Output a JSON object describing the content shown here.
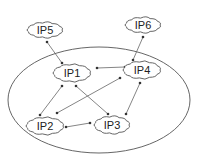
{
  "diagram": {
    "type": "network",
    "boundary": {
      "shape": "ellipse",
      "cx": 99,
      "cy": 100,
      "rx": 91,
      "ry": 53
    },
    "nodes": [
      {
        "id": "IP1",
        "label": "IP1",
        "cx": 72,
        "cy": 73,
        "w": 42,
        "h": 22,
        "inside_boundary": true
      },
      {
        "id": "IP2",
        "label": "IP2",
        "cx": 45,
        "cy": 126,
        "w": 42,
        "h": 22,
        "inside_boundary": true
      },
      {
        "id": "IP3",
        "label": "IP3",
        "cx": 112,
        "cy": 125,
        "w": 40,
        "h": 22,
        "inside_boundary": true
      },
      {
        "id": "IP4",
        "label": "IP4",
        "cx": 142,
        "cy": 70,
        "w": 42,
        "h": 22,
        "inside_boundary": true
      },
      {
        "id": "IP5",
        "label": "IP5",
        "cx": 45,
        "cy": 30,
        "w": 40,
        "h": 20,
        "inside_boundary": false
      },
      {
        "id": "IP6",
        "label": "IP6",
        "cx": 143,
        "cy": 25,
        "w": 40,
        "h": 20,
        "inside_boundary": false
      }
    ],
    "edges": [
      {
        "from": "IP1",
        "to": "IP5",
        "x1": 62,
        "y1": 63,
        "x2": 47,
        "y2": 42
      },
      {
        "from": "IP4",
        "to": "IP6",
        "x1": 133,
        "y1": 60,
        "x2": 143,
        "y2": 37
      },
      {
        "from": "IP1",
        "to": "IP4",
        "x1": 97,
        "y1": 68,
        "x2": 125,
        "y2": 67
      },
      {
        "from": "IP1",
        "to": "IP2",
        "x1": 62,
        "y1": 86,
        "x2": 40,
        "y2": 115
      },
      {
        "from": "IP1",
        "to": "IP3",
        "x1": 76,
        "y1": 86,
        "x2": 108,
        "y2": 114
      },
      {
        "from": "IP4",
        "to": "IP2",
        "x1": 120,
        "y1": 78,
        "x2": 57,
        "y2": 113
      },
      {
        "from": "IP3",
        "to": "IP4",
        "x1": 126,
        "y1": 114,
        "x2": 140,
        "y2": 83
      },
      {
        "from": "IP2",
        "to": "IP3",
        "x1": 66,
        "y1": 127,
        "x2": 90,
        "y2": 123
      }
    ],
    "colors": {
      "stroke": "#555555",
      "edge": "#666666",
      "text": "#222222",
      "background": "#ffffff"
    }
  }
}
